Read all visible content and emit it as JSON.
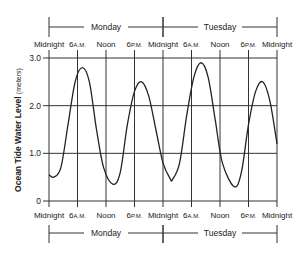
{
  "chart_data": {
    "type": "line",
    "title": "",
    "xlabel": "",
    "ylabel": "Ocean Tide Water Level (meters)",
    "ylabel_main": "Ocean Tide Water Level",
    "ylabel_unit": "(meters)",
    "ylim": [
      0,
      3.0
    ],
    "yticks": [
      "0",
      "1.0",
      "2.0",
      "3.0"
    ],
    "ytick_values": [
      0,
      1.0,
      2.0,
      3.0
    ],
    "grid": true,
    "legend": null,
    "x_hours_range": [
      0,
      48
    ],
    "xtick_hours": [
      0,
      6,
      12,
      18,
      24,
      30,
      36,
      42,
      48
    ],
    "xticks": [
      {
        "main": "Midnight",
        "suffix": ""
      },
      {
        "main": "6",
        "suffix": "A.M."
      },
      {
        "main": "Noon",
        "suffix": ""
      },
      {
        "main": "6",
        "suffix": "P.M."
      },
      {
        "main": "Midnight",
        "suffix": ""
      },
      {
        "main": "6",
        "suffix": "A.M."
      },
      {
        "main": "Noon",
        "suffix": ""
      },
      {
        "main": "6",
        "suffix": "P.M."
      },
      {
        "main": "Midnight",
        "suffix": ""
      }
    ],
    "days": [
      "Monday",
      "Tuesday"
    ],
    "series": [
      {
        "name": "Ocean tide water level",
        "x_hours": [
          0,
          1,
          2.5,
          4,
          5.5,
          7,
          8.5,
          10,
          11.5,
          13.5,
          15,
          16.5,
          18,
          19.5,
          21,
          22.5,
          24,
          25.5,
          26,
          27.5,
          29,
          30.5,
          32,
          33.5,
          35,
          36.5,
          39,
          40.5,
          42,
          43.5,
          45,
          46.5,
          48
        ],
        "values": [
          0.55,
          0.5,
          0.7,
          1.6,
          2.5,
          2.8,
          2.5,
          1.5,
          0.7,
          0.35,
          0.6,
          1.6,
          2.3,
          2.5,
          2.2,
          1.5,
          0.8,
          0.47,
          0.45,
          0.8,
          1.8,
          2.6,
          2.9,
          2.6,
          1.7,
          0.8,
          0.3,
          0.6,
          1.6,
          2.3,
          2.5,
          2.1,
          1.2
        ]
      }
    ]
  }
}
